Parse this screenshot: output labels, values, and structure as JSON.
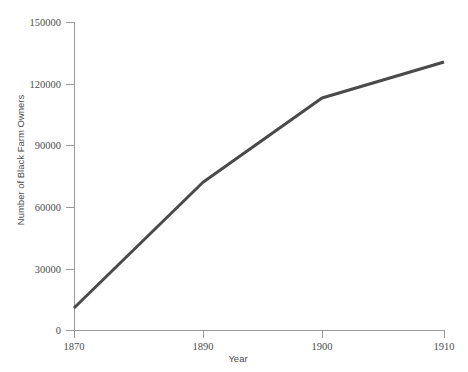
{
  "chart_data": {
    "type": "line",
    "title": "",
    "xlabel": "Year",
    "ylabel": "Number of Black Farm Owners",
    "x": [
      1870,
      1890,
      1900,
      1910
    ],
    "xtick_labels": [
      "1870",
      "1890",
      "1900",
      "1910"
    ],
    "values": [
      10700,
      72000,
      113000,
      130500
    ],
    "series": [
      {
        "name": "Number of Black Farm Owners",
        "values": [
          10700,
          72000,
          113000,
          130500
        ]
      }
    ],
    "ytick_labels": [
      "0",
      "30000",
      "60000",
      "90000",
      "120000",
      "150000"
    ],
    "yticks": [
      0,
      30000,
      60000,
      90000,
      120000,
      150000
    ],
    "ylim": [
      0,
      150000
    ],
    "xlim": [
      1870,
      1910
    ],
    "x_spacing": "non-linear",
    "grid": false,
    "legend": false,
    "line_color": "#4a4a4a",
    "axis_color": "#9a9a9a",
    "text_color": "#4d4d4d",
    "background": "#ffffff"
  },
  "geometry": {
    "plot_left": 74,
    "plot_right": 444,
    "plot_top": 22,
    "plot_bottom": 330,
    "x_pixels": [
      74,
      203,
      322,
      444
    ],
    "y_pixels": [
      330,
      269,
      207,
      145,
      84,
      22
    ],
    "point_pixels": [
      [
        74,
        308
      ],
      [
        203,
        182
      ],
      [
        322,
        98
      ],
      [
        444,
        62
      ]
    ]
  }
}
